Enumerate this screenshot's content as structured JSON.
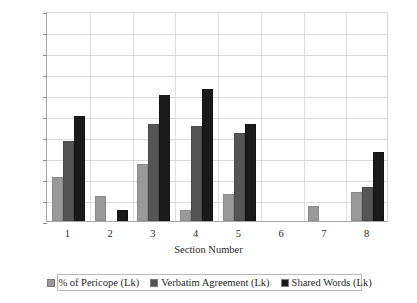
{
  "chart_data": {
    "type": "bar",
    "title": "",
    "xlabel": "Section Number",
    "ylabel": "",
    "categories": [
      "1",
      "2",
      "3",
      "4",
      "5",
      "6",
      "7",
      "8"
    ],
    "ylim": [
      0,
      100
    ],
    "ytick_labels": [
      "100%",
      "90%",
      "80%",
      "70%",
      "60%",
      "50%",
      "40%",
      "30%",
      "20%",
      "10%",
      "0%"
    ],
    "ytick_values": [
      100,
      90,
      80,
      70,
      60,
      50,
      40,
      30,
      20,
      10,
      0
    ],
    "grid": true,
    "legend_position": "bottom",
    "series": [
      {
        "name": "% of Pericope (Lk)",
        "color": "#999999",
        "values": [
          21,
          12,
          27,
          5,
          13,
          0,
          7,
          14
        ]
      },
      {
        "name": "Verbatim Agreement (Lk)",
        "color": "#555555",
        "values": [
          38,
          0,
          46,
          45,
          42,
          0,
          0,
          16
        ]
      },
      {
        "name": "Shared Words (Lk)",
        "color": "#1a1a1a",
        "values": [
          50,
          5,
          60,
          63,
          46,
          0,
          0,
          33
        ]
      }
    ]
  },
  "axis": {
    "x_title": "Section Number"
  }
}
